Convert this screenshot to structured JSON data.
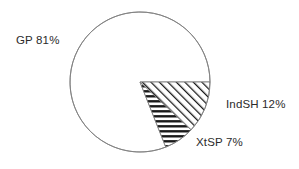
{
  "chart_data": {
    "type": "pie",
    "title": "",
    "subtitle": "",
    "xlabel": "",
    "ylabel": "",
    "legend_position": "none",
    "grid": false,
    "labels": [
      "GP",
      "IndSH",
      "XtSP"
    ],
    "values": [
      81,
      12,
      7
    ],
    "units": "%",
    "slices": [
      {
        "name": "GP",
        "value": 81,
        "display_label": "GP 81%",
        "fill_pattern": "none",
        "fill_color": "#ffffff",
        "start_angle_deg": 68.4,
        "end_angle_deg": 360
      },
      {
        "name": "IndSH",
        "value": 12,
        "display_label": "IndSH 12%",
        "fill_pattern": "diagonal-hatch",
        "fill_color": "#ffffff",
        "start_angle_deg": 0,
        "end_angle_deg": 43.2
      },
      {
        "name": "XtSP",
        "value": 7,
        "display_label": "XtSP 7%",
        "fill_pattern": "horizontal-hatch",
        "fill_color": "#ffffff",
        "start_angle_deg": 43.2,
        "end_angle_deg": 68.4
      }
    ],
    "geometry": {
      "center_x": 140,
      "center_y": 82,
      "radius": 70,
      "start_angle_deg": 0,
      "direction": "clockwise"
    },
    "style": {
      "background": "#ffffff",
      "outline_color": "#808080",
      "hatch_color": "#1a1a1a",
      "text_color": "#2b2b2b"
    },
    "label_positions": {
      "gp": {
        "x": 16,
        "y": 44
      },
      "indsh": {
        "x": 226,
        "y": 108
      },
      "xtsp": {
        "x": 196,
        "y": 146
      }
    }
  }
}
